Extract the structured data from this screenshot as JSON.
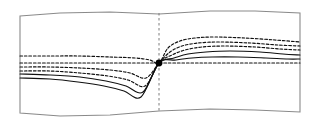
{
  "figure": {
    "title": "",
    "background_color": "#ffffff",
    "frame_color": "#8a8a8a",
    "curve_color": "#101010",
    "shock_line_color": "#7d7d7d",
    "node_color": "#000000"
  },
  "chart_data": {
    "type": "line",
    "title": "",
    "subtitle": "",
    "xlabel": "",
    "ylabel": "",
    "xlim": [
      0,
      319
    ],
    "ylim": [
      125,
      0
    ],
    "grid": false,
    "legend": null,
    "legend_position": "none",
    "annotations": [
      {
        "name": "convergence-node",
        "kind": "point-marker",
        "x": 159,
        "y": 63,
        "radius": 3.4,
        "label": ""
      },
      {
        "name": "vertical-dashed-line",
        "kind": "reference-line",
        "orientation": "vertical",
        "x": 159,
        "y_start": 13,
        "y_end": 113,
        "dash": [
          2.5,
          2.5
        ]
      }
    ],
    "frame": {
      "name": "distorted-rectangle-frame",
      "closed": true,
      "points": [
        [
          20,
          16
        ],
        [
          60,
          13
        ],
        [
          110,
          12
        ],
        [
          159,
          14
        ],
        [
          210,
          11
        ],
        [
          255,
          11
        ],
        [
          300,
          13
        ],
        [
          300,
          60
        ],
        [
          300,
          112
        ],
        [
          255,
          110
        ],
        [
          210,
          109
        ],
        [
          159,
          111
        ],
        [
          110,
          115
        ],
        [
          60,
          116
        ],
        [
          20,
          113
        ],
        [
          20,
          60
        ]
      ]
    },
    "series": [
      {
        "name": "curve-1",
        "style": "dashed",
        "points": [
          [
            20,
            56
          ],
          [
            50,
            56
          ],
          [
            80,
            56
          ],
          [
            110,
            57
          ],
          [
            135,
            58
          ],
          [
            150,
            60
          ],
          [
            159,
            63
          ],
          [
            168,
            48
          ],
          [
            180,
            41
          ],
          [
            195,
            38
          ],
          [
            215,
            37
          ],
          [
            245,
            38
          ],
          [
            275,
            40
          ],
          [
            300,
            42
          ]
        ]
      },
      {
        "name": "curve-2",
        "style": "dashed",
        "points": [
          [
            20,
            63
          ],
          [
            50,
            63
          ],
          [
            80,
            63
          ],
          [
            110,
            63
          ],
          [
            135,
            63
          ],
          [
            150,
            63
          ],
          [
            159,
            63
          ],
          [
            175,
            63
          ],
          [
            200,
            63
          ],
          [
            230,
            63
          ],
          [
            265,
            63
          ],
          [
            300,
            63
          ]
        ]
      },
      {
        "name": "curve-3",
        "style": "dashed",
        "points": [
          [
            20,
            67
          ],
          [
            50,
            67
          ],
          [
            80,
            68
          ],
          [
            110,
            70
          ],
          [
            130,
            73
          ],
          [
            146,
            78
          ],
          [
            159,
            63
          ],
          [
            170,
            52
          ],
          [
            182,
            46
          ],
          [
            198,
            43
          ],
          [
            220,
            42
          ],
          [
            250,
            43
          ],
          [
            278,
            45
          ],
          [
            300,
            46
          ]
        ]
      },
      {
        "name": "curve-4",
        "style": "dashed",
        "points": [
          [
            20,
            71
          ],
          [
            50,
            71
          ],
          [
            80,
            73
          ],
          [
            108,
            76
          ],
          [
            128,
            80
          ],
          [
            145,
            86
          ],
          [
            159,
            63
          ],
          [
            172,
            55
          ],
          [
            185,
            50
          ],
          [
            202,
            47
          ],
          [
            225,
            46
          ],
          [
            255,
            47
          ],
          [
            280,
            49
          ],
          [
            300,
            50
          ]
        ]
      },
      {
        "name": "curve-5",
        "style": "solid",
        "points": [
          [
            20,
            74
          ],
          [
            50,
            75
          ],
          [
            80,
            77
          ],
          [
            106,
            81
          ],
          [
            126,
            86
          ],
          [
            143,
            92
          ],
          [
            159,
            63
          ],
          [
            174,
            58
          ],
          [
            188,
            54
          ],
          [
            206,
            52
          ],
          [
            230,
            51
          ],
          [
            260,
            52
          ],
          [
            283,
            54
          ],
          [
            300,
            55
          ]
        ]
      },
      {
        "name": "curve-6",
        "style": "solid",
        "points": [
          [
            20,
            78
          ],
          [
            50,
            79
          ],
          [
            78,
            82
          ],
          [
            104,
            86
          ],
          [
            124,
            91
          ],
          [
            141,
            97
          ],
          [
            159,
            63
          ],
          [
            176,
            60
          ],
          [
            192,
            58
          ],
          [
            212,
            57
          ],
          [
            238,
            57
          ],
          [
            266,
            58
          ],
          [
            288,
            59
          ],
          [
            300,
            59
          ]
        ]
      }
    ]
  }
}
